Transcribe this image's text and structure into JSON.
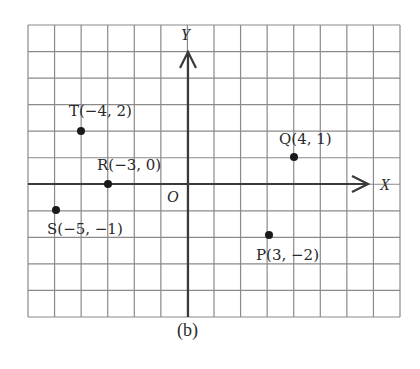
{
  "figure": {
    "caption": "(b)",
    "axes": {
      "x_label": "X",
      "y_label": "Y",
      "origin_label": "O"
    },
    "grid": {
      "x_min": -6,
      "x_max": 8,
      "y_min": -5,
      "y_max": 6,
      "show_grid": true
    },
    "points": [
      {
        "name": "T",
        "x": -4,
        "y": 2,
        "label": "T(−4, 2)"
      },
      {
        "name": "R",
        "x": -3,
        "y": 0,
        "label": "R(−3, 0)"
      },
      {
        "name": "S",
        "x": -5,
        "y": -1,
        "label": "S(−5, −1)"
      },
      {
        "name": "Q",
        "x": 4,
        "y": 1,
        "label": "Q(4, 1)"
      },
      {
        "name": "P",
        "x": 3,
        "y": -2,
        "label": "P(3, −2)"
      }
    ]
  }
}
